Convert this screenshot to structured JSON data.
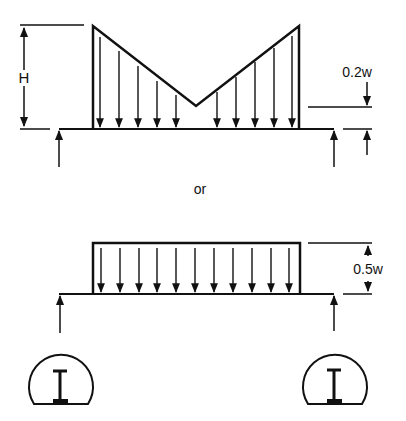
{
  "diagram": {
    "top_load": {
      "shape": "V-shaped (trapezoidal-triangular) distributed load",
      "height_label": "H",
      "offset_label": "0.2w",
      "arrow_count": 10
    },
    "separator_label": "or",
    "bottom_load": {
      "shape": "uniform rectangular distributed load",
      "height_label": "0.5w",
      "arrow_count": 11
    },
    "supports": [
      {
        "side": "left",
        "glyph": "I"
      },
      {
        "side": "right",
        "glyph": "I"
      }
    ],
    "colors": {
      "stroke": "#111111",
      "background": "#ffffff"
    }
  }
}
